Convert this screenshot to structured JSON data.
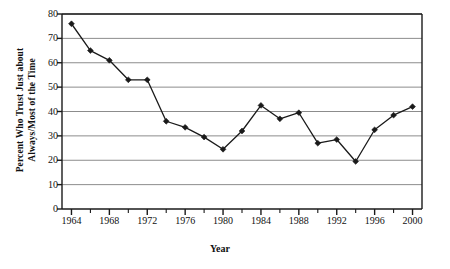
{
  "chart_data": {
    "type": "line",
    "title": "",
    "xlabel": "Year",
    "ylabel": "Percent Who Trust Just about Always/Most of the Time",
    "ylabel_line1": "Percent Who Trust Just about",
    "ylabel_line2": "Always/Most of the Time",
    "x": [
      1964,
      1966,
      1968,
      1970,
      1972,
      1974,
      1976,
      1978,
      1980,
      1982,
      1984,
      1986,
      1988,
      1990,
      1992,
      1994,
      1996,
      1998,
      2000
    ],
    "values": [
      76,
      65,
      61,
      53,
      53,
      36,
      33.5,
      29.5,
      24.5,
      32,
      42.5,
      37,
      39.5,
      27,
      28.5,
      19.5,
      32.5,
      38.5,
      42
    ],
    "xlim": [
      1963,
      2001
    ],
    "ylim": [
      0,
      80
    ],
    "ytick_values": [
      0,
      10,
      20,
      30,
      40,
      50,
      60,
      70,
      80
    ],
    "ytick_labels": [
      "0",
      "10",
      "20",
      "30",
      "40",
      "50",
      "60",
      "70",
      "80"
    ],
    "xtick_values": [
      1964,
      1968,
      1972,
      1976,
      1980,
      1984,
      1988,
      1992,
      1996,
      2000
    ],
    "xtick_labels": [
      "1964",
      "1968",
      "1972",
      "1976",
      "1980",
      "1984",
      "1988",
      "1992",
      "1996",
      "2000"
    ],
    "xminor_values": [
      1966,
      1970,
      1974,
      1978,
      1982,
      1986,
      1990,
      1994,
      1998
    ],
    "grid": "horizontal",
    "legend": "none",
    "series_color": "#1a1a1a",
    "grid_color": "#8c8c8c",
    "axis_color": "#1a1a1a",
    "marker": "diamond"
  }
}
